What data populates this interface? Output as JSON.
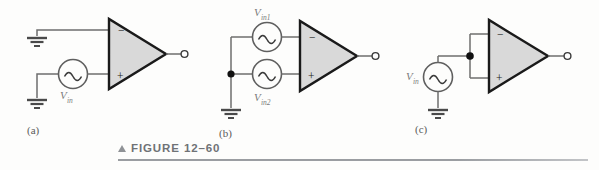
{
  "figure": {
    "caption_label": "FIGURE 12–60",
    "marker_icon": "triangle-up-icon",
    "accent_color": "#6f7276",
    "rule_color": "#9a9da1"
  },
  "colors": {
    "wire": "#6e6e6e",
    "opamp_fill": "#d9d9d9",
    "opamp_stroke": "#1a1a1a",
    "source_stroke": "#5f5f5f",
    "label_text": "#7b7b7b",
    "sublabel_text": "#5a5a5a",
    "node_dot": "#111111",
    "terminal_fill": "#ffffff"
  },
  "circuits": [
    {
      "id": "a",
      "sublabel": "(a)",
      "opamp": {
        "name": "op-amp-a",
        "inverting_label": "−",
        "noninverting_label": "+"
      },
      "sources": [
        {
          "name": "source-vin",
          "label": "V",
          "sub": "in",
          "waveform": "sine",
          "label_pos": "below"
        }
      ],
      "grounds": [
        "ground-top-a",
        "ground-bottom-a"
      ],
      "output_terminal": "output-terminal-a"
    },
    {
      "id": "b",
      "sublabel": "(b)",
      "opamp": {
        "name": "op-amp-b",
        "inverting_label": "−",
        "noninverting_label": "+"
      },
      "sources": [
        {
          "name": "source-vin1",
          "label": "V",
          "sub": "in1",
          "waveform": "sine",
          "label_pos": "above"
        },
        {
          "name": "source-vin2",
          "label": "V",
          "sub": "in2",
          "waveform": "sine",
          "label_pos": "below"
        }
      ],
      "grounds": [
        "ground-b"
      ],
      "junction": "junction-dot-b",
      "output_terminal": "output-terminal-b"
    },
    {
      "id": "c",
      "sublabel": "(c)",
      "opamp": {
        "name": "op-amp-c",
        "inverting_label": "−",
        "noninverting_label": "+"
      },
      "sources": [
        {
          "name": "source-vin-c",
          "label": "V",
          "sub": "in",
          "waveform": "sine",
          "label_pos": "left"
        }
      ],
      "grounds": [
        "ground-c"
      ],
      "junction": "junction-dot-c",
      "output_terminal": "output-terminal-c"
    }
  ]
}
